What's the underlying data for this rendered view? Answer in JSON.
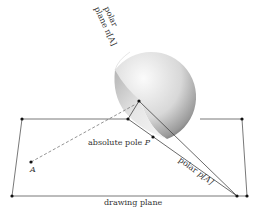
{
  "labels": {
    "polar_plane_line1": "polar",
    "polar_plane_line2": "plane π[A]",
    "absolute_pole": "absolute pole ",
    "absolute_pole_var": "P",
    "polar_line": "polar ",
    "polar_line_var": "p[A]",
    "point_a": "A",
    "drawing_plane": "drawing plane"
  },
  "colors": {
    "line": "#555555",
    "point": "#111111",
    "sphere_light": "#f2f2f2",
    "sphere_dark": "#6a6a6a"
  }
}
